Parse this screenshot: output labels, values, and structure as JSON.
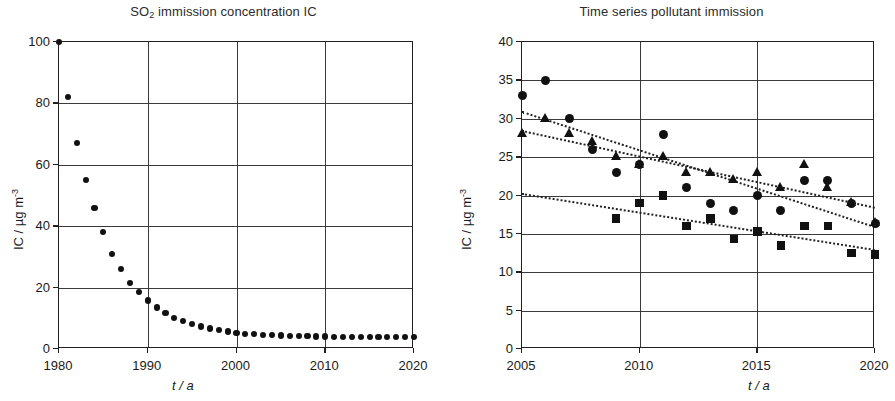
{
  "chart_data": [
    {
      "type": "scatter",
      "title": "SO2 immission concentration IC",
      "title_main": "SO",
      "title_sub": "2",
      "title_rest": " immission concentration IC",
      "xlabel": "t / a",
      "ylabel": "IC / µg m",
      "ylabel_exp": "-3",
      "xlim": [
        1980,
        2020
      ],
      "ylim": [
        0,
        100
      ],
      "xticks": [
        1980,
        1990,
        2000,
        2010,
        2020
      ],
      "yticks": [
        0,
        20,
        40,
        60,
        80,
        100
      ],
      "grid": true,
      "legend": null,
      "series": [
        {
          "name": "SO2",
          "marker": "circle",
          "x": [
            1980,
            1981,
            1982,
            1983,
            1984,
            1985,
            1986,
            1987,
            1988,
            1989,
            1990,
            1991,
            1992,
            1993,
            1994,
            1995,
            1996,
            1997,
            1998,
            1999,
            2000,
            2001,
            2002,
            2003,
            2004,
            2005,
            2006,
            2007,
            2008,
            2009,
            2010,
            2011,
            2012,
            2013,
            2014,
            2015,
            2016,
            2017,
            2018,
            2019,
            2020
          ],
          "values": [
            100,
            82,
            67,
            55,
            46,
            38,
            31,
            26,
            21.5,
            18.5,
            15.8,
            13.5,
            11.6,
            10.2,
            9.1,
            8.1,
            7.3,
            6.7,
            6.1,
            5.7,
            5.3,
            5.0,
            4.8,
            4.6,
            4.5,
            4.4,
            4.3,
            4.2,
            4.2,
            4.1,
            4.1,
            4.0,
            4.0,
            4.0,
            3.9,
            3.9,
            3.9,
            3.9,
            3.8,
            3.8,
            3.8
          ]
        }
      ]
    },
    {
      "type": "scatter",
      "title": "Time series pollutant immission",
      "xlabel": "t / a",
      "ylabel": "IC / µg m",
      "ylabel_exp": "-3",
      "xlim": [
        2005,
        2020
      ],
      "ylim": [
        0,
        40
      ],
      "xticks": [
        2005,
        2010,
        2015,
        2020
      ],
      "yticks": [
        0,
        5,
        10,
        15,
        20,
        25,
        30,
        35,
        40
      ],
      "grid": true,
      "legend_position": "top-right",
      "series": [
        {
          "name": "NOx",
          "label_main": "NO",
          "label_sub": "x",
          "marker": "triangle",
          "x": [
            2005,
            2006,
            2007,
            2008,
            2009,
            2010,
            2011,
            2012,
            2013,
            2014,
            2015,
            2016,
            2017,
            2018,
            2019,
            2020
          ],
          "values": [
            28,
            30,
            28,
            27,
            25,
            24,
            25,
            23,
            23,
            22,
            23,
            21,
            24,
            21,
            19,
            16.5
          ],
          "trend": {
            "x0": 2005,
            "y0": 28.5,
            "x1": 2020,
            "y1": 18.5
          }
        },
        {
          "name": "PM2.5",
          "marker": "square",
          "x": [
            2009,
            2010,
            2011,
            2012,
            2013,
            2014,
            2015,
            2016,
            2017,
            2018,
            2019,
            2020
          ],
          "values": [
            17,
            19,
            20,
            16,
            17,
            14.3,
            15.3,
            13.5,
            16,
            16,
            12.5,
            12.3
          ],
          "trend": {
            "x0": 2005,
            "y0": 20.3,
            "x1": 2020,
            "y1": 13.0
          }
        },
        {
          "name": "PM10",
          "marker": "circle",
          "x": [
            2005,
            2006,
            2007,
            2008,
            2009,
            2010,
            2011,
            2012,
            2013,
            2014,
            2015,
            2016,
            2017,
            2018,
            2019,
            2020
          ],
          "values": [
            33,
            35,
            30,
            26,
            23,
            24,
            28,
            21,
            19,
            18,
            20,
            18,
            22,
            22,
            19,
            16.3
          ],
          "trend": {
            "x0": 2005,
            "y0": 31.0,
            "x1": 2020,
            "y1": 16.0
          }
        }
      ]
    }
  ]
}
